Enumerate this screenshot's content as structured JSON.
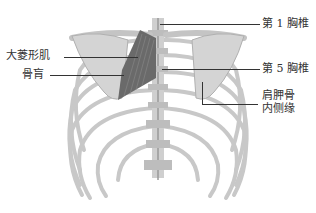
{
  "figure": {
    "colors": {
      "bone": "#d8d8d8",
      "bone_shade": "#b4b4b4",
      "muscle": "#6a6a6a",
      "line": "#333333"
    }
  },
  "labels": {
    "rhomboid_major": "大菱形肌",
    "bone": "骨肓",
    "t1": "第 1 胸椎",
    "t5": "第 5 胸椎",
    "scapula_medial_line1": "肩胛骨",
    "scapula_medial_line2": "内侧缘"
  }
}
